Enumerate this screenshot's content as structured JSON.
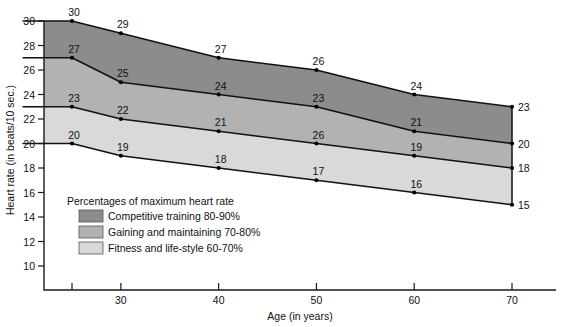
{
  "chart_data": {
    "type": "area",
    "title": "",
    "xlabel": "Age (in years)",
    "ylabel": "Heart rate (in beats/10 sec.)",
    "x": [
      20,
      25,
      30,
      40,
      50,
      60,
      70
    ],
    "xlim": [
      18,
      72
    ],
    "ylim": [
      9,
      31
    ],
    "xticks": [
      25,
      30,
      40,
      50,
      60,
      70
    ],
    "xticklabels": [
      "",
      "30",
      "40",
      "50",
      "60",
      "70"
    ],
    "yticks": [
      10,
      12,
      14,
      16,
      18,
      20,
      22,
      24,
      26,
      28,
      30
    ],
    "yticklabels": [
      "10",
      "12",
      "14",
      "16",
      "18",
      "20",
      "22",
      "24",
      "26",
      "28",
      "30"
    ],
    "grid": false,
    "legend_position": "inside-lower-left",
    "series": [
      {
        "name": "Upper bound 90% of maximum heart rate",
        "values": [
          30,
          30,
          29,
          27,
          26,
          24,
          23
        ],
        "labels": [
          "",
          "30",
          "29",
          "27",
          "26",
          "24",
          "23"
        ],
        "color": "#111111"
      },
      {
        "name": "Boundary 80% of maximum heart rate",
        "values": [
          27,
          27,
          25,
          24,
          23,
          21,
          20
        ],
        "labels": [
          "",
          "27",
          "25",
          "24",
          "23",
          "21",
          "20"
        ],
        "color": "#111111"
      },
      {
        "name": "Boundary 70% of maximum heart rate",
        "values": [
          23,
          23,
          22,
          21,
          20,
          19,
          18
        ],
        "labels": [
          "",
          "23",
          "22",
          "21",
          "26",
          "19",
          "18"
        ],
        "color": "#111111"
      },
      {
        "name": "Lower bound 60% of maximum heart rate",
        "values": [
          20,
          20,
          19,
          18,
          17,
          16,
          15
        ],
        "labels": [
          "",
          "20",
          "19",
          "18",
          "17",
          "16",
          "15"
        ],
        "color": "#111111"
      }
    ],
    "bands": [
      {
        "name": "Competitive training 80-90%",
        "color": "#8c8c8c",
        "upper_series": 0,
        "lower_series": 1
      },
      {
        "name": "Gaining and maintaining 70-80%",
        "color": "#b2b2b2",
        "upper_series": 1,
        "lower_series": 2
      },
      {
        "name": "Fitness and life-style 60-70%",
        "color": "#d9d9d9",
        "upper_series": 2,
        "lower_series": 3
      }
    ]
  },
  "legend": {
    "title": "Percentages of maximum heart rate",
    "items": [
      {
        "label": "Competitive training 80-90%",
        "color": "#8c8c8c"
      },
      {
        "label": "Gaining and maintaining 70-80%",
        "color": "#b2b2b2"
      },
      {
        "label": "Fitness and life-style 60-70%",
        "color": "#d9d9d9"
      }
    ]
  }
}
